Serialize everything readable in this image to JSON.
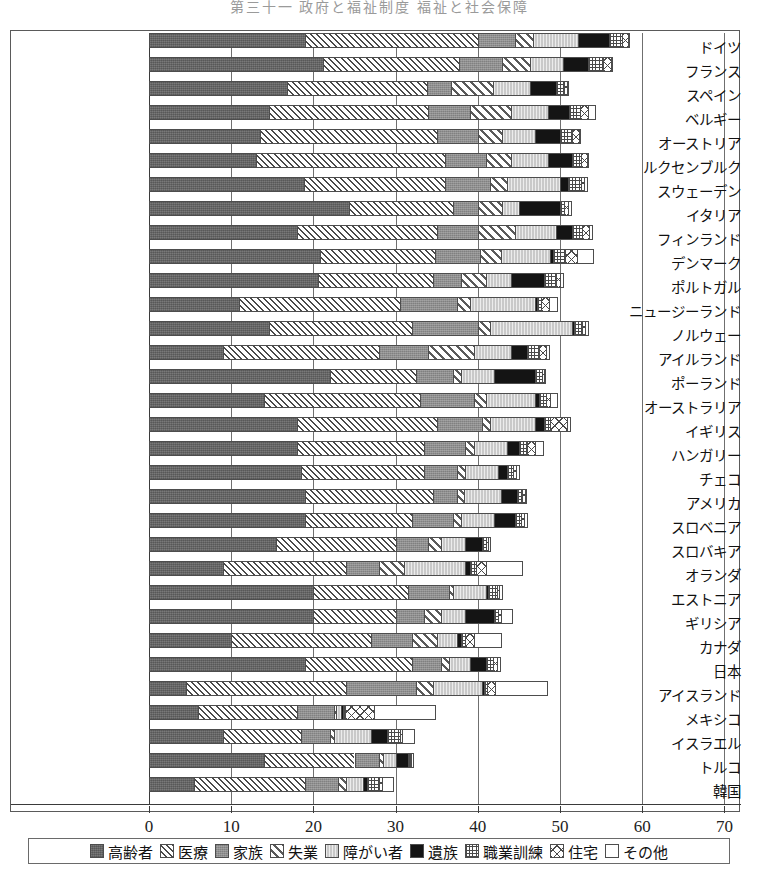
{
  "top_caption": "第三十一 政府と福祉制度 福祉と社会保障",
  "chart_data": {
    "type": "bar",
    "orientation": "horizontal",
    "stacked": true,
    "title": "",
    "xlabel": "",
    "ylabel": "",
    "xlim": [
      0,
      70
    ],
    "xticks": [
      0,
      10,
      20,
      30,
      40,
      50,
      60,
      70
    ],
    "xtick_labels": [
      "0",
      "10",
      "20",
      "30",
      "40",
      "50",
      "60",
      "70"
    ],
    "grid": true,
    "legend_position": "bottom",
    "categories": [
      "ドイツ",
      "フランス",
      "スペイン",
      "ベルギー",
      "オーストリア",
      "ルクセンブルク",
      "スウェーデン",
      "イタリア",
      "フィンランド",
      "デンマーク",
      "ポルトガル",
      "ニュージーランド",
      "ノルウェー",
      "アイルランド",
      "ポーランド",
      "オーストラリア",
      "イギリス",
      "ハンガリー",
      "チェコ",
      "アメリカ",
      "スロベニア",
      "スロバキア",
      "オランダ",
      "エストニア",
      "ギリシア",
      "カナダ",
      "日本",
      "アイスランド",
      "メキシコ",
      "イスラエル",
      "トルコ",
      "韓国"
    ],
    "series": [
      {
        "name": "高齢者",
        "pattern": "solid-dark-gray",
        "values": [
          19.0,
          21.2,
          16.8,
          14.6,
          13.5,
          13.0,
          18.8,
          24.3,
          18.0,
          20.8,
          20.5,
          11.0,
          14.6,
          9.0,
          22.0,
          14.0,
          18.0,
          18.0,
          18.5,
          19.0,
          19.0,
          15.5,
          9.0,
          20.0,
          20.0,
          10.0,
          19.0,
          4.5,
          6.0,
          9.0,
          14.0,
          5.5
        ]
      },
      {
        "name": "医療",
        "pattern": "diagonal-hatch-fine",
        "values": [
          21.0,
          16.5,
          17.0,
          19.3,
          21.5,
          23.0,
          17.2,
          12.7,
          17.0,
          14.0,
          14.0,
          19.5,
          17.4,
          19.0,
          10.5,
          19.0,
          17.0,
          15.5,
          15.0,
          15.5,
          13.0,
          14.5,
          15.0,
          11.5,
          10.0,
          17.0,
          13.0,
          19.5,
          12.0,
          9.5,
          11.0,
          13.5
        ]
      },
      {
        "name": "家族",
        "pattern": "solid-mid-gray",
        "values": [
          4.5,
          5.2,
          3.0,
          5.1,
          5.0,
          5.0,
          5.5,
          3.0,
          5.0,
          5.5,
          3.5,
          7.0,
          8.0,
          6.0,
          4.5,
          6.5,
          5.5,
          5.0,
          4.0,
          3.0,
          5.0,
          4.0,
          4.0,
          5.0,
          3.5,
          5.0,
          3.5,
          8.5,
          4.5,
          3.5,
          3.0,
          4.0
        ]
      },
      {
        "name": "失業",
        "pattern": "diagonal-hatch-wide",
        "values": [
          2.2,
          3.5,
          5.0,
          5.0,
          3.0,
          3.0,
          2.0,
          3.0,
          4.5,
          2.5,
          3.0,
          1.5,
          1.5,
          5.5,
          1.0,
          1.5,
          1.0,
          1.0,
          1.0,
          0.8,
          1.0,
          1.5,
          3.0,
          0.5,
          2.0,
          3.0,
          1.0,
          2.0,
          0.3,
          0.5,
          0.5,
          1.0
        ]
      },
      {
        "name": "障がい者",
        "pattern": "light-gray-vertical",
        "values": [
          5.5,
          4.0,
          4.5,
          4.6,
          4.0,
          4.5,
          6.5,
          2.0,
          5.0,
          6.0,
          3.0,
          8.0,
          10.0,
          4.5,
          4.0,
          6.0,
          5.5,
          4.0,
          4.0,
          4.5,
          4.0,
          3.0,
          7.5,
          4.0,
          3.0,
          2.5,
          2.5,
          6.0,
          0.5,
          4.5,
          1.5,
          2.0
        ]
      },
      {
        "name": "遺族",
        "pattern": "solid-black",
        "values": [
          3.8,
          3.0,
          3.2,
          2.5,
          3.0,
          3.0,
          1.0,
          5.0,
          2.0,
          0.3,
          4.0,
          0.2,
          0.2,
          2.0,
          5.0,
          0.5,
          1.0,
          1.5,
          1.0,
          2.0,
          2.5,
          2.0,
          0.5,
          0.3,
          3.5,
          0.5,
          2.0,
          0.3,
          0.3,
          2.0,
          1.5,
          0.5
        ]
      },
      {
        "name": "職業訓練",
        "pattern": "grid-dots",
        "values": [
          1.5,
          1.8,
          1.0,
          1.3,
          1.5,
          1.0,
          1.5,
          0.5,
          1.2,
          1.5,
          1.5,
          0.5,
          1.0,
          1.5,
          0.8,
          0.8,
          0.8,
          1.0,
          0.8,
          0.6,
          0.8,
          0.5,
          0.8,
          1.0,
          0.5,
          0.5,
          0.8,
          0.3,
          0.3,
          1.5,
          0.2,
          1.5
        ]
      },
      {
        "name": "住宅",
        "pattern": "cross-diagonal",
        "values": [
          0.8,
          1.0,
          0.3,
          1.0,
          0.8,
          0.8,
          0.4,
          0.5,
          0.8,
          1.5,
          0.5,
          1.0,
          0.3,
          0.8,
          0.3,
          0.5,
          2.0,
          1.0,
          0.3,
          0.3,
          0.3,
          0.3,
          1.2,
          0.3,
          0.3,
          1.0,
          0.5,
          1.0,
          3.5,
          0.3,
          0.2,
          0.3
        ]
      },
      {
        "name": "その他",
        "pattern": "white-empty",
        "values": [
          0.2,
          0.3,
          0.2,
          1.0,
          0.2,
          0.2,
          0.5,
          0.5,
          0.5,
          2.0,
          0.5,
          1.0,
          0.5,
          0.5,
          0.2,
          1.0,
          0.5,
          1.0,
          0.5,
          0.3,
          0.5,
          0.3,
          4.5,
          0.5,
          1.5,
          3.5,
          0.5,
          6.5,
          7.5,
          1.5,
          0.3,
          1.5
        ]
      }
    ]
  },
  "legend": {
    "items": [
      {
        "label": "高齢者",
        "key": "elderly"
      },
      {
        "label": "医療",
        "key": "medical"
      },
      {
        "label": "家族",
        "key": "family"
      },
      {
        "label": "失業",
        "key": "unemployment"
      },
      {
        "label": "障がい者",
        "key": "disability"
      },
      {
        "label": "遺族",
        "key": "survivors"
      },
      {
        "label": "職業訓練",
        "key": "training"
      },
      {
        "label": "住宅",
        "key": "housing"
      },
      {
        "label": "その他",
        "key": "other"
      }
    ]
  }
}
